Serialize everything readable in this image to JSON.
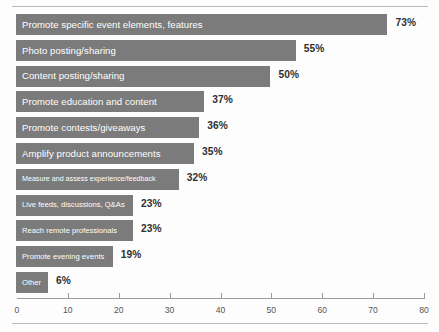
{
  "chart_data": {
    "type": "bar",
    "orientation": "horizontal",
    "title": "",
    "xlabel": "",
    "ylabel": "",
    "xlim": [
      0,
      80
    ],
    "xticks": [
      0,
      10,
      20,
      30,
      40,
      50,
      60,
      70,
      80
    ],
    "grid": false,
    "legend": false,
    "unit": "%",
    "bar_color": "#7b7b7b",
    "value_label_color": "#2f2f2f",
    "bar_label_color": "#ffffff",
    "categories": [
      "Promote specific event elements, features",
      "Photo posting/sharing",
      "Content posting/sharing",
      "Promote education and content",
      "Promote contests/giveaways",
      "Amplify product announcements",
      "Measure and assess experience/feedback",
      "Live feeds, discussions, Q&As",
      "Reach remote professionals",
      "Promote evening events",
      "Other"
    ],
    "values": [
      73,
      55,
      50,
      37,
      36,
      35,
      32,
      23,
      23,
      19,
      6
    ],
    "value_labels": [
      "73%",
      "55%",
      "50%",
      "37%",
      "36%",
      "35%",
      "32%",
      "23%",
      "23%",
      "19%",
      "6%"
    ],
    "tick_labels": [
      "0",
      "10",
      "20",
      "30",
      "40",
      "50",
      "60",
      "70",
      "80"
    ]
  }
}
